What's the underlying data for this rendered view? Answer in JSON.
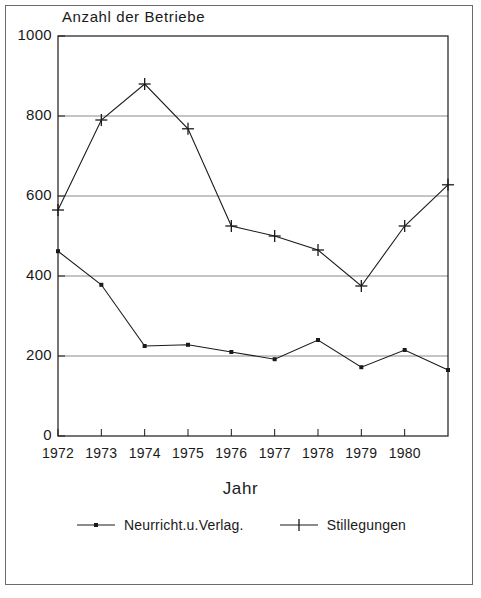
{
  "figure": {
    "title": "Anzahl der Betriebe",
    "xaxis_title": "Jahr",
    "border_color": "#6b6b6b",
    "ink_color": "#1a1a1a",
    "grid_color": "#8a8a8a"
  },
  "chart_data": {
    "type": "line",
    "title": "Anzahl der Betriebe",
    "xlabel": "Jahr",
    "ylabel": "Anzahl der Betriebe",
    "x": [
      1972,
      1973,
      1974,
      1975,
      1976,
      1977,
      1978,
      1979,
      1980,
      1981
    ],
    "categories": [
      "1972",
      "1973",
      "1974",
      "1975",
      "1976",
      "1977",
      "1978",
      "1979",
      "1980",
      ""
    ],
    "xtick_labels": [
      "1972",
      "1973",
      "1974",
      "1975",
      "1976",
      "1977",
      "1978",
      "1979",
      "1980"
    ],
    "ytick_labels": [
      "0",
      "200",
      "400",
      "600",
      "800",
      "1000"
    ],
    "ytick_values": [
      0,
      200,
      400,
      600,
      800,
      1000
    ],
    "ylim": [
      0,
      1000
    ],
    "xlim": [
      1972,
      1981
    ],
    "grid": "horizontal",
    "legend_position": "bottom",
    "series": [
      {
        "name": "Neurricht.u.Verlag.",
        "marker": "square-dot",
        "values": [
          462,
          378,
          225,
          228,
          210,
          192,
          240,
          172,
          215,
          165
        ]
      },
      {
        "name": "Stillegungen",
        "marker": "plus",
        "values": [
          565,
          790,
          880,
          768,
          525,
          500,
          465,
          375,
          525,
          628
        ]
      }
    ]
  },
  "legend": {
    "entries": [
      {
        "label": "Neurricht.u.Verlag.",
        "marker": "square-dot"
      },
      {
        "label": "Stillegungen",
        "marker": "plus"
      }
    ]
  }
}
